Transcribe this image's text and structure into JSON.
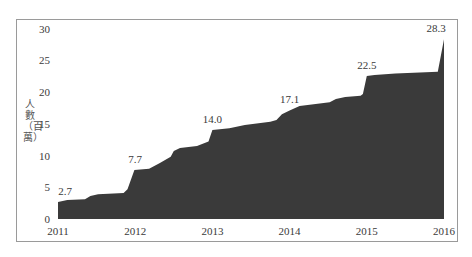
{
  "chart_data": {
    "type": "area",
    "title": "",
    "xlabel": "",
    "ylabel": "人數（百萬）",
    "ylim": [
      0,
      30
    ],
    "yticks": [
      0,
      5,
      10,
      15,
      20,
      25,
      30
    ],
    "xticks": [
      "2011",
      "2012",
      "2013",
      "2014",
      "2015",
      "2016"
    ],
    "xlim": [
      2011,
      2016
    ],
    "grid": false,
    "legend": null,
    "fill_color": "#3a3a3a",
    "series": [
      {
        "name": "人數",
        "x": [
          2011.0,
          2011.12,
          2011.35,
          2011.42,
          2011.52,
          2011.85,
          2011.9,
          2011.99,
          2012.18,
          2012.32,
          2012.46,
          2012.5,
          2012.58,
          2012.8,
          2012.95,
          2013.0,
          2013.22,
          2013.42,
          2013.75,
          2013.83,
          2013.9,
          2014.0,
          2014.13,
          2014.52,
          2014.6,
          2014.72,
          2014.92,
          2014.95,
          2015.0,
          2015.1,
          2015.37,
          2015.92,
          2016.0
        ],
        "values": [
          2.7,
          3.0,
          3.1,
          3.6,
          3.9,
          4.1,
          4.7,
          7.7,
          7.9,
          8.8,
          9.8,
          10.7,
          11.2,
          11.5,
          12.2,
          14.0,
          14.3,
          14.8,
          15.3,
          15.6,
          16.5,
          17.1,
          17.8,
          18.4,
          18.9,
          19.2,
          19.4,
          19.7,
          22.5,
          22.7,
          22.9,
          23.2,
          28.3
        ]
      }
    ],
    "annotations": [
      {
        "x": 2011.0,
        "value": 2.7,
        "label": "2.7"
      },
      {
        "x": 2012.0,
        "value": 7.7,
        "label": "7.7"
      },
      {
        "x": 2013.0,
        "value": 14.0,
        "label": "14.0"
      },
      {
        "x": 2014.0,
        "value": 17.1,
        "label": "17.1"
      },
      {
        "x": 2015.0,
        "value": 22.5,
        "label": "22.5"
      },
      {
        "x": 2016.0,
        "value": 28.3,
        "label": "28.3"
      }
    ]
  }
}
